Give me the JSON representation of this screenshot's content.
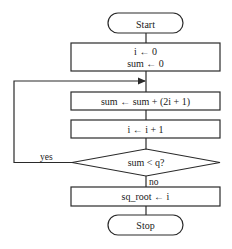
{
  "diagram": {
    "type": "flowchart",
    "title": "",
    "nodes": [
      {
        "id": "start",
        "kind": "terminal",
        "label": "Start"
      },
      {
        "id": "init",
        "kind": "process",
        "lines": [
          "i ← 0",
          "sum ← 0"
        ]
      },
      {
        "id": "accumulate",
        "kind": "process",
        "label": "sum ← sum + (2i + 1)"
      },
      {
        "id": "increment",
        "kind": "process",
        "label": "i ← i + 1"
      },
      {
        "id": "check",
        "kind": "decision",
        "label": "sum < q?"
      },
      {
        "id": "assign",
        "kind": "process",
        "label": "sq_root ← i"
      },
      {
        "id": "stop",
        "kind": "terminal",
        "label": "Stop"
      }
    ],
    "edges": [
      {
        "from": "start",
        "to": "init"
      },
      {
        "from": "init",
        "to": "accumulate"
      },
      {
        "from": "accumulate",
        "to": "increment"
      },
      {
        "from": "increment",
        "to": "check"
      },
      {
        "from": "check",
        "to": "accumulate",
        "label": "yes"
      },
      {
        "from": "check",
        "to": "assign",
        "label": "no"
      },
      {
        "from": "assign",
        "to": "stop"
      }
    ],
    "colors": {
      "stroke": "#2a2a2a",
      "fill": "#ffffff",
      "text": "#1a1a1a"
    }
  }
}
